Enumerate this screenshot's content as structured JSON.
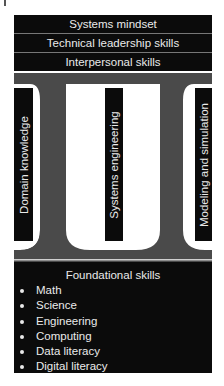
{
  "top_bands": [
    {
      "label": "Systems mindset"
    },
    {
      "label": "Technical leadership skills"
    },
    {
      "label": "Interpersonal skills"
    }
  ],
  "columns": [
    {
      "label": "Domain knowledge"
    },
    {
      "label": "Systems engineering"
    },
    {
      "label": "Modeling and simulation"
    }
  ],
  "foundation": {
    "title": "Foundational skills",
    "items": [
      {
        "label": "Math"
      },
      {
        "label": "Science"
      },
      {
        "label": "Engineering"
      },
      {
        "label": "Computing"
      },
      {
        "label": "Data literacy"
      },
      {
        "label": "Digital literacy"
      }
    ]
  },
  "colors": {
    "block": "#0b0b0b",
    "pillar": "#4a4a4a",
    "text": "#eaeaea",
    "background": "#ffffff"
  }
}
